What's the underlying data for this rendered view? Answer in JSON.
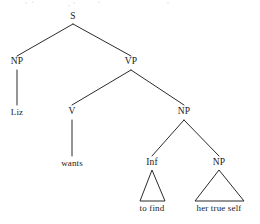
{
  "diagram": {
    "type": "constituency-syntax-tree",
    "sentence": "Liz wants to find her true self",
    "line_color": "#2b2b2b",
    "text_color": "#1a1a1a",
    "background_color": "#ffffff",
    "nodes": [
      {
        "id": "s",
        "label": "S",
        "x": 73,
        "y": 17,
        "kind": "category"
      },
      {
        "id": "np1",
        "label": "NP",
        "x": 17,
        "y": 62,
        "kind": "category"
      },
      {
        "id": "vp",
        "label": "VP",
        "x": 131,
        "y": 62,
        "kind": "category"
      },
      {
        "id": "liz",
        "label": "Liz",
        "x": 17,
        "y": 112,
        "kind": "terminal"
      },
      {
        "id": "v",
        "label": "V",
        "x": 72,
        "y": 112,
        "kind": "category"
      },
      {
        "id": "np2",
        "label": "NP",
        "x": 184,
        "y": 112,
        "kind": "category"
      },
      {
        "id": "wants",
        "label": "wants",
        "x": 72,
        "y": 163,
        "kind": "terminal"
      },
      {
        "id": "inf",
        "label": "Inf",
        "x": 152,
        "y": 163,
        "kind": "category"
      },
      {
        "id": "np3",
        "label": "NP",
        "x": 219,
        "y": 163,
        "kind": "category"
      },
      {
        "id": "tofind",
        "label": "to find",
        "x": 152,
        "y": 208,
        "kind": "terminal"
      },
      {
        "id": "hts",
        "label": "her true self",
        "x": 219,
        "y": 208,
        "kind": "terminal"
      }
    ],
    "edges": [
      {
        "from": "s",
        "to": "np1",
        "x1": 73,
        "y1": 24,
        "x2": 17,
        "y2": 56,
        "style": "line"
      },
      {
        "from": "s",
        "to": "vp",
        "x1": 73,
        "y1": 24,
        "x2": 131,
        "y2": 56,
        "style": "line"
      },
      {
        "from": "np1",
        "to": "liz",
        "x1": 17,
        "y1": 70,
        "x2": 17,
        "y2": 105,
        "style": "line"
      },
      {
        "from": "vp",
        "to": "v",
        "x1": 131,
        "y1": 70,
        "x2": 72,
        "y2": 105,
        "style": "line"
      },
      {
        "from": "vp",
        "to": "np2",
        "x1": 131,
        "y1": 70,
        "x2": 184,
        "y2": 105,
        "style": "line"
      },
      {
        "from": "v",
        "to": "wants",
        "x1": 72,
        "y1": 120,
        "x2": 72,
        "y2": 156,
        "style": "line"
      },
      {
        "from": "np2",
        "to": "inf",
        "x1": 184,
        "y1": 120,
        "x2": 152,
        "y2": 156,
        "style": "line"
      },
      {
        "from": "np2",
        "to": "np3",
        "x1": 184,
        "y1": 120,
        "x2": 219,
        "y2": 156,
        "style": "line"
      }
    ],
    "triangles": [
      {
        "from": "inf",
        "to": "tofind",
        "apex_x": 152,
        "apex_y": 170,
        "left_x": 140,
        "right_x": 165,
        "base_y": 201
      },
      {
        "from": "np3",
        "to": "hts",
        "apex_x": 219,
        "apex_y": 170,
        "left_x": 195,
        "right_x": 244,
        "base_y": 201
      }
    ]
  }
}
